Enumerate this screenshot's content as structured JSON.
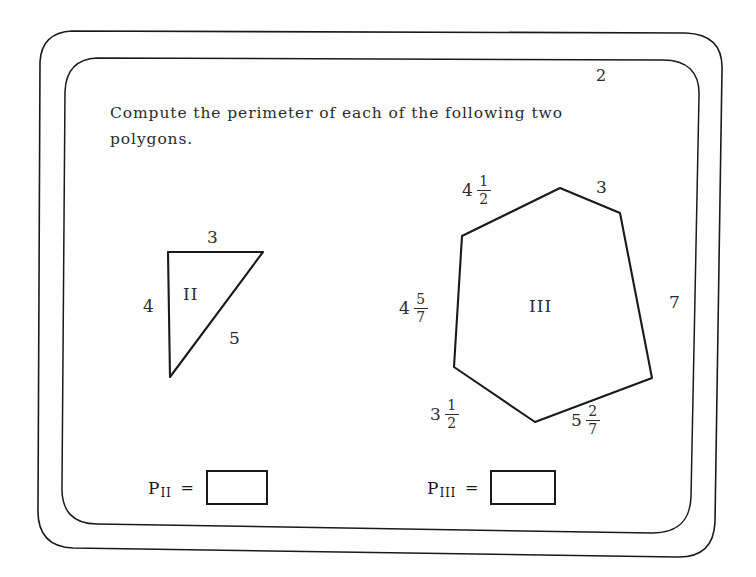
{
  "worksheet": {
    "corner_number": "2",
    "prompt": "Compute the perimeter of each of the following two polygons.",
    "prompt_line1": "Compute the perimeter of each of the follow-",
    "prompt_line2": "ing two polygons."
  },
  "figures": [
    {
      "id": "polygon-ii",
      "name": "II",
      "shape": "right-triangle",
      "side_labels": [
        {
          "key": "top",
          "text": "3",
          "type": "integer"
        },
        {
          "key": "left",
          "text": "4",
          "type": "integer"
        },
        {
          "key": "hypotenuse",
          "text": "5",
          "type": "integer"
        }
      ]
    },
    {
      "id": "polygon-iii",
      "name": "III",
      "shape": "hexagon",
      "side_labels": [
        {
          "key": "upper-left",
          "whole": "4",
          "num": "1",
          "den": "2",
          "type": "mixed"
        },
        {
          "key": "upper-right",
          "text": "3",
          "type": "integer"
        },
        {
          "key": "right",
          "text": "7",
          "type": "integer"
        },
        {
          "key": "lower-right",
          "whole": "5",
          "num": "2",
          "den": "7",
          "type": "mixed"
        },
        {
          "key": "lower-left",
          "whole": "3",
          "num": "1",
          "den": "2",
          "type": "mixed"
        },
        {
          "key": "left",
          "whole": "4",
          "num": "5",
          "den": "7",
          "type": "mixed"
        }
      ]
    }
  ],
  "answers": [
    {
      "id": "answer-ii",
      "symbol": "P",
      "subscript": "II",
      "equals": "=",
      "value": ""
    },
    {
      "id": "answer-iii",
      "symbol": "P",
      "subscript": "III",
      "equals": "=",
      "value": ""
    }
  ],
  "colors": {
    "ink": "#1a1a1a",
    "text": "#2b2b2b",
    "paper": "#ffffff"
  }
}
